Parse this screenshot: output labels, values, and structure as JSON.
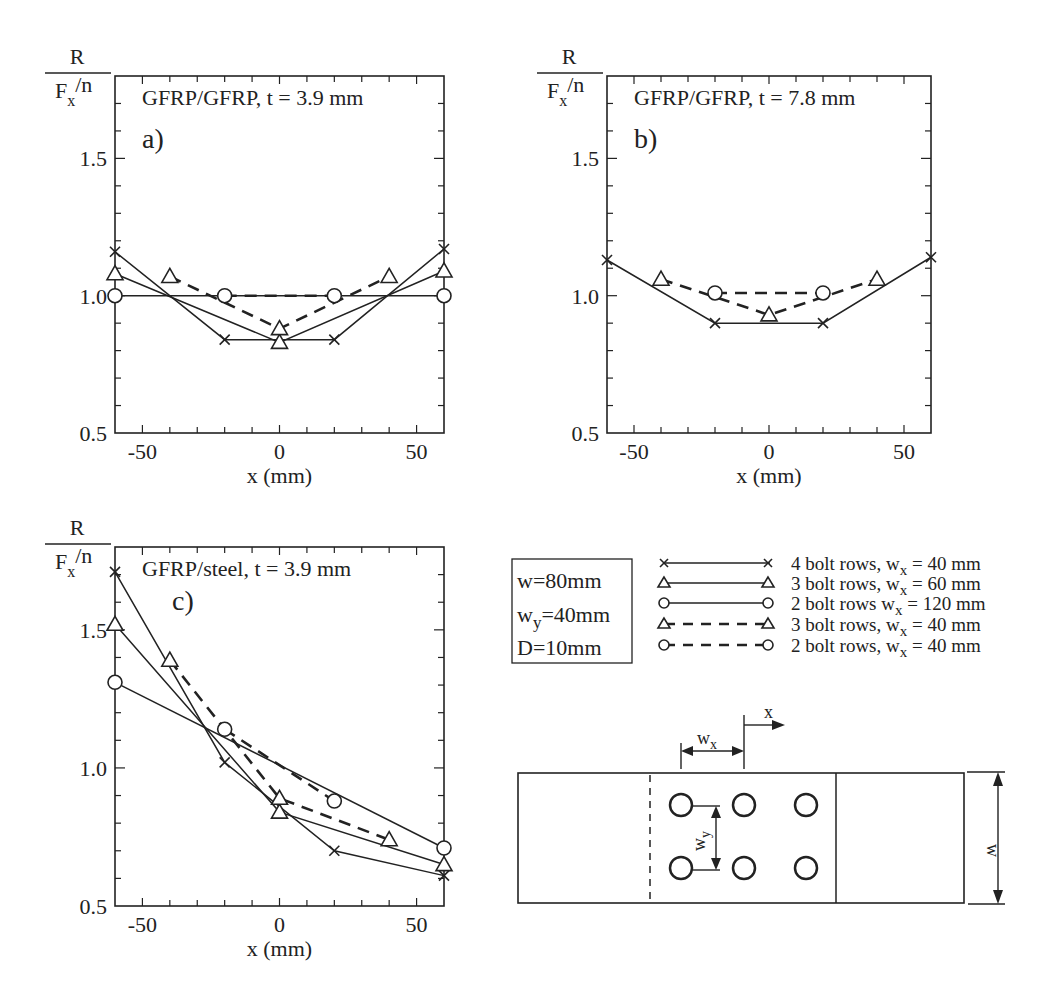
{
  "figure": {
    "ylabel_num": "R",
    "ylabel_den_main": "F",
    "ylabel_den_sub": "x",
    "ylabel_den_tail": "/n",
    "xlabel": "x  (mm)",
    "yticks": [
      "0.5",
      "1.0",
      "1.5"
    ],
    "xticks": [
      "-50",
      "0",
      "50"
    ]
  },
  "params_box": {
    "lines": [
      {
        "main": "w",
        "sub": "",
        "rest": "=80mm"
      },
      {
        "main": "w",
        "sub": "y",
        "rest": "=40mm"
      },
      {
        "main": "D",
        "sub": "",
        "rest": "=10mm"
      }
    ]
  },
  "legend": [
    {
      "marker": "x",
      "dash": false,
      "pre": "4 bolt rows, w",
      "sub": "x",
      "post": " = 40 mm"
    },
    {
      "marker": "triangle",
      "dash": false,
      "pre": "3 bolt rows, w",
      "sub": "x",
      "post": " = 60 mm"
    },
    {
      "marker": "circle",
      "dash": false,
      "pre": "2 bolt rows w",
      "sub": "x",
      "post": " = 120 mm"
    },
    {
      "marker": "triangle",
      "dash": true,
      "pre": "3 bolt rows, w",
      "sub": "x",
      "post": " = 40 mm"
    },
    {
      "marker": "circle",
      "dash": true,
      "pre": "2 bolt rows, w",
      "sub": "x",
      "post": " = 40 mm"
    }
  ],
  "diagram": {
    "label_x": "x",
    "label_wx_main": "w",
    "label_wx_sub": "x",
    "label_wy_main": "w",
    "label_wy_sub": "y",
    "label_w": "w"
  },
  "chart_data": [
    {
      "type": "line",
      "panel": "a)",
      "title": "GFRP/GFRP, t = 3.9 mm",
      "xlabel": "x (mm)",
      "ylabel": "R / (Fx/n)",
      "xlim": [
        -60,
        60
      ],
      "ylim": [
        0.5,
        1.8
      ],
      "xticks": [
        -50,
        0,
        50
      ],
      "yticks": [
        0.5,
        1.0,
        1.5
      ],
      "grid": false,
      "series": [
        {
          "name": "4 bolt rows, wx = 40 mm",
          "marker": "x",
          "dash": false,
          "x": [
            -60,
            -20,
            20,
            60
          ],
          "y": [
            1.16,
            0.84,
            0.84,
            1.17
          ]
        },
        {
          "name": "3 bolt rows, wx = 60 mm",
          "marker": "triangle",
          "dash": false,
          "x": [
            -60,
            0,
            60
          ],
          "y": [
            1.08,
            0.83,
            1.09
          ]
        },
        {
          "name": "2 bolt rows wx = 120 mm",
          "marker": "circle",
          "dash": false,
          "x": [
            -60,
            60
          ],
          "y": [
            1.0,
            1.0
          ]
        },
        {
          "name": "3 bolt rows, wx = 40 mm",
          "marker": "triangle",
          "dash": true,
          "x": [
            -40,
            0,
            40
          ],
          "y": [
            1.07,
            0.88,
            1.07
          ]
        },
        {
          "name": "2 bolt rows, wx = 40 mm",
          "marker": "circle",
          "dash": true,
          "x": [
            -20,
            20
          ],
          "y": [
            1.0,
            1.0
          ]
        }
      ]
    },
    {
      "type": "line",
      "panel": "b)",
      "title": "GFRP/GFRP, t = 7.8 mm",
      "xlabel": "x (mm)",
      "ylabel": "R / (Fx/n)",
      "xlim": [
        -60,
        60
      ],
      "ylim": [
        0.5,
        1.8
      ],
      "xticks": [
        -50,
        0,
        50
      ],
      "yticks": [
        0.5,
        1.0,
        1.5
      ],
      "grid": false,
      "series": [
        {
          "name": "4 bolt rows, wx = 40 mm",
          "marker": "x",
          "dash": false,
          "x": [
            -60,
            -20,
            20,
            60
          ],
          "y": [
            1.13,
            0.9,
            0.9,
            1.14
          ]
        },
        {
          "name": "3 bolt rows, wx = 40 mm",
          "marker": "triangle",
          "dash": true,
          "x": [
            -40,
            0,
            40
          ],
          "y": [
            1.06,
            0.93,
            1.06
          ]
        },
        {
          "name": "2 bolt rows, wx = 40 mm",
          "marker": "circle",
          "dash": true,
          "x": [
            -20,
            20
          ],
          "y": [
            1.01,
            1.01
          ]
        }
      ]
    },
    {
      "type": "line",
      "panel": "c)",
      "title": "GFRP/steel, t = 3.9 mm",
      "xlabel": "x (mm)",
      "ylabel": "R / (Fx/n)",
      "xlim": [
        -60,
        60
      ],
      "ylim": [
        0.5,
        1.8
      ],
      "xticks": [
        -50,
        0,
        50
      ],
      "yticks": [
        0.5,
        1.0,
        1.5
      ],
      "grid": false,
      "series": [
        {
          "name": "4 bolt rows, wx = 40 mm",
          "marker": "x",
          "dash": false,
          "x": [
            -60,
            -20,
            20,
            60
          ],
          "y": [
            1.71,
            1.02,
            0.7,
            0.61
          ]
        },
        {
          "name": "3 bolt rows, wx = 60 mm",
          "marker": "triangle",
          "dash": false,
          "x": [
            -60,
            0,
            60
          ],
          "y": [
            1.52,
            0.84,
            0.65
          ]
        },
        {
          "name": "2 bolt rows wx = 120 mm",
          "marker": "circle",
          "dash": false,
          "x": [
            -60,
            60
          ],
          "y": [
            1.31,
            0.71
          ]
        },
        {
          "name": "3 bolt rows, wx = 40 mm",
          "marker": "triangle",
          "dash": true,
          "x": [
            -40,
            0,
            40
          ],
          "y": [
            1.39,
            0.89,
            0.74
          ]
        },
        {
          "name": "2 bolt rows, wx = 40 mm",
          "marker": "circle",
          "dash": true,
          "x": [
            -20,
            20
          ],
          "y": [
            1.14,
            0.88
          ]
        }
      ]
    }
  ]
}
